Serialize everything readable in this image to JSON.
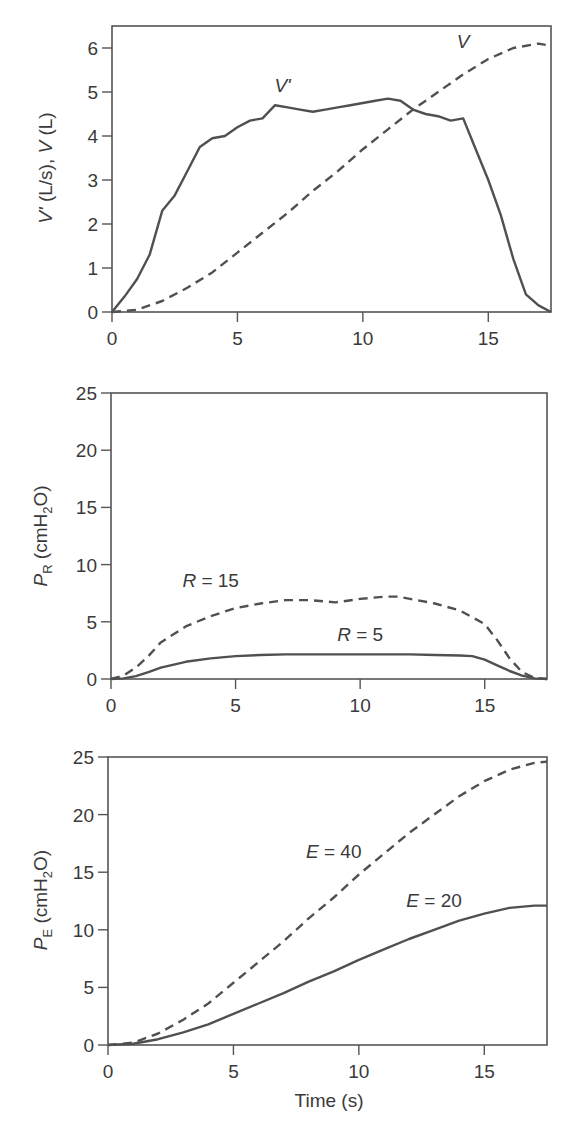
{
  "chart_data": [
    {
      "type": "line",
      "title": "",
      "xlabel": "",
      "ylabel": "V' (L/s), V (L)",
      "ylabel_parts": {
        "v1": "V'",
        "u1": " (L/s), ",
        "v2": "V",
        "u2": " (L)"
      },
      "xlim": [
        0,
        17.5
      ],
      "ylim": [
        0,
        6.5
      ],
      "xticks": [
        "0",
        "5",
        "10",
        "15"
      ],
      "yticks": [
        "0",
        "1",
        "2",
        "3",
        "4",
        "5",
        "6"
      ],
      "grid": false,
      "series": [
        {
          "name": "V'",
          "style": "solid",
          "x": [
            0,
            0.5,
            1,
            1.5,
            2,
            2.5,
            3,
            3.5,
            4,
            4.5,
            5,
            5.5,
            6,
            6.5,
            7,
            7.5,
            8,
            8.5,
            9,
            9.5,
            10,
            10.5,
            11,
            11.5,
            12,
            12.5,
            13,
            13.5,
            14,
            14.5,
            15,
            15.5,
            16,
            16.5,
            17,
            17.5
          ],
          "values": [
            0,
            0.35,
            0.75,
            1.3,
            2.3,
            2.65,
            3.2,
            3.75,
            3.95,
            4.0,
            4.2,
            4.35,
            4.4,
            4.7,
            4.65,
            4.6,
            4.55,
            4.6,
            4.65,
            4.7,
            4.75,
            4.8,
            4.85,
            4.8,
            4.6,
            4.5,
            4.45,
            4.35,
            4.4,
            3.7,
            3.0,
            2.2,
            1.2,
            0.4,
            0.15,
            0
          ]
        },
        {
          "name": "V",
          "style": "dashed",
          "x": [
            0,
            1,
            2,
            3,
            4,
            5,
            6,
            7,
            8,
            9,
            10,
            11,
            12,
            13,
            14,
            15,
            16,
            17,
            17.5
          ],
          "values": [
            0,
            0.05,
            0.25,
            0.55,
            0.9,
            1.35,
            1.8,
            2.25,
            2.75,
            3.2,
            3.7,
            4.15,
            4.6,
            5.0,
            5.4,
            5.75,
            6.0,
            6.1,
            6.05
          ]
        }
      ],
      "annotations": [
        {
          "text": "V'",
          "x": 6.8,
          "y": 5.0
        },
        {
          "text": "V",
          "x": 14.0,
          "y": 6.0
        }
      ]
    },
    {
      "type": "line",
      "title": "",
      "xlabel": "",
      "ylabel": "PR (cmH2O)",
      "ylabel_parts": {
        "p": "P",
        "psub": "R",
        "u1": " (cmH",
        "usub": "2",
        "u2": "O)"
      },
      "xlim": [
        0,
        17.5
      ],
      "ylim": [
        0,
        25
      ],
      "xticks": [
        "0",
        "5",
        "10",
        "15"
      ],
      "yticks": [
        "0",
        "5",
        "10",
        "15",
        "20",
        "25"
      ],
      "grid": false,
      "series": [
        {
          "name": "R = 15",
          "style": "dashed",
          "x": [
            0,
            0.5,
            1,
            1.5,
            2,
            3,
            4,
            5,
            6,
            7,
            8,
            9,
            10,
            11,
            11.5,
            12,
            13,
            14,
            15,
            15.5,
            16,
            16.5,
            17,
            17.5
          ],
          "values": [
            0,
            0.3,
            1.0,
            2.0,
            3.2,
            4.6,
            5.5,
            6.2,
            6.6,
            6.9,
            6.9,
            6.7,
            7.0,
            7.2,
            7.2,
            7.0,
            6.6,
            6.0,
            4.8,
            3.4,
            1.8,
            0.6,
            0.1,
            0
          ]
        },
        {
          "name": "R = 5",
          "style": "solid",
          "x": [
            0,
            0.5,
            1,
            1.5,
            2,
            3,
            4,
            5,
            6,
            7,
            8,
            9,
            10,
            11,
            12,
            13,
            14,
            14.5,
            15,
            15.5,
            16,
            16.5,
            17,
            17.5
          ],
          "values": [
            0,
            0.05,
            0.25,
            0.6,
            1.0,
            1.5,
            1.8,
            2.0,
            2.1,
            2.15,
            2.15,
            2.15,
            2.15,
            2.15,
            2.15,
            2.1,
            2.05,
            2.0,
            1.7,
            1.2,
            0.7,
            0.3,
            0.05,
            0
          ]
        }
      ],
      "annotations": [
        {
          "text": "R = 15",
          "x": 4.0,
          "y": 8.0
        },
        {
          "text": "R = 5",
          "x": 10.0,
          "y": 3.3
        }
      ]
    },
    {
      "type": "line",
      "title": "",
      "xlabel": "Time (s)",
      "ylabel": "PE (cmH2O)",
      "ylabel_parts": {
        "p": "P",
        "psub": "E",
        "u1": " (cmH",
        "usub": "2",
        "u2": "O)"
      },
      "xlim": [
        0,
        17.5
      ],
      "ylim": [
        0,
        25
      ],
      "xticks": [
        "0",
        "5",
        "10",
        "15"
      ],
      "yticks": [
        "0",
        "5",
        "10",
        "15",
        "20",
        "25"
      ],
      "grid": false,
      "series": [
        {
          "name": "E = 40",
          "style": "dashed",
          "x": [
            0,
            1,
            2,
            3,
            4,
            5,
            6,
            7,
            8,
            9,
            10,
            11,
            12,
            13,
            14,
            15,
            16,
            17,
            17.5
          ],
          "values": [
            0,
            0.2,
            1.0,
            2.2,
            3.6,
            5.4,
            7.2,
            9.0,
            11.0,
            12.8,
            14.8,
            16.6,
            18.4,
            20.0,
            21.6,
            22.9,
            23.9,
            24.5,
            24.6
          ]
        },
        {
          "name": "E = 20",
          "style": "solid",
          "x": [
            0,
            1,
            2,
            3,
            4,
            5,
            6,
            7,
            8,
            9,
            10,
            11,
            12,
            13,
            14,
            15,
            16,
            17,
            17.5
          ],
          "values": [
            0,
            0.1,
            0.5,
            1.1,
            1.8,
            2.7,
            3.6,
            4.5,
            5.5,
            6.4,
            7.4,
            8.3,
            9.2,
            10.0,
            10.8,
            11.4,
            11.9,
            12.1,
            12.1
          ]
        }
      ],
      "annotations": [
        {
          "text": "E = 40",
          "x": 9.0,
          "y": 16.2
        },
        {
          "text": "E = 20",
          "x": 13.0,
          "y": 12.0
        }
      ]
    }
  ]
}
